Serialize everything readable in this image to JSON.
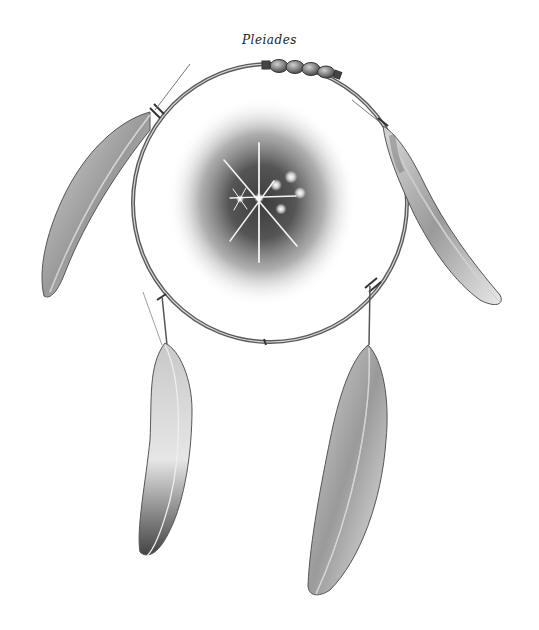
{
  "title": "Pleiades",
  "illustration": {
    "subject": "dreamcatcher hoop with feathers framing the Pleiades star cluster",
    "style": "graphite pencil drawing",
    "colors": {
      "background": "#ffffff",
      "ink": "#2a2a2a",
      "sky_dark": "#3a3a3a",
      "star": "#ffffff"
    },
    "elements": {
      "hoop": "circular wooden hoop with wrapped bindings",
      "beads": 4,
      "feathers": 4,
      "stars": [
        "central bright star with rays",
        "small star left",
        "cluster star 1",
        "cluster star 2",
        "cluster star 3",
        "cluster star 4"
      ]
    }
  }
}
